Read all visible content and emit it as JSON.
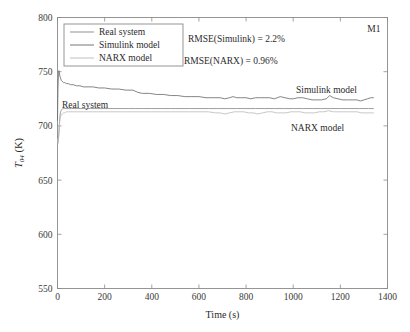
{
  "chart_data": {
    "type": "line",
    "title": "",
    "xlabel": "Time (s)",
    "ylabel": "T",
    "ylabel_sub": "04",
    "ylabel_unit": " (K)",
    "xlim": [
      0,
      1400
    ],
    "ylim": [
      550,
      800
    ],
    "xticks": [
      0,
      200,
      400,
      600,
      800,
      1000,
      1200,
      1400
    ],
    "yticks": [
      550,
      600,
      650,
      700,
      750,
      800
    ],
    "grid": false,
    "legend_position": "top-left",
    "corner_annotation": "M1",
    "annotations": [
      {
        "name": "rmse-simulink",
        "text": "RMSE(Simulink) = 2.2%"
      },
      {
        "name": "rmse-narx",
        "text": "RMSE(NARX) = 0.96%"
      },
      {
        "name": "curve-label-real-system",
        "text": "Real system"
      },
      {
        "name": "curve-label-simulink",
        "text": "Simulink model"
      },
      {
        "name": "curve-label-narx",
        "text": "NARX model"
      }
    ],
    "series": [
      {
        "name": "Real system",
        "color": "#8c8c8c",
        "x": [
          0,
          3,
          6,
          9,
          12,
          15,
          18,
          22,
          26,
          30,
          36,
          42,
          50,
          60,
          72,
          86,
          100,
          120,
          140,
          160,
          185,
          210,
          240,
          270,
          300,
          330,
          360,
          400,
          440,
          480,
          520,
          560,
          600,
          640,
          680,
          720,
          760,
          800,
          840,
          880,
          920,
          960,
          1000,
          1040,
          1080,
          1120,
          1160,
          1200,
          1240,
          1280,
          1320,
          1340
        ],
        "y": [
          690,
          686,
          694,
          706,
          712,
          714,
          715,
          716,
          716,
          716,
          716,
          716,
          716,
          716,
          716,
          716,
          716,
          716,
          716,
          716,
          716,
          716,
          716,
          716,
          716,
          716,
          716,
          716,
          716,
          716,
          716,
          716,
          716,
          716,
          716,
          716,
          716,
          716,
          716,
          716,
          716,
          716,
          716,
          716,
          716,
          716,
          716,
          716,
          716,
          716,
          716,
          716
        ]
      },
      {
        "name": "Simulink model",
        "color": "#6f6f6f",
        "x": [
          0,
          2,
          4,
          6,
          8,
          10,
          13,
          16,
          20,
          25,
          30,
          38,
          46,
          56,
          68,
          80,
          95,
          110,
          130,
          150,
          175,
          200,
          230,
          260,
          290,
          320,
          340,
          360,
          390,
          420,
          450,
          480,
          510,
          540,
          570,
          600,
          630,
          660,
          690,
          710,
          730,
          745,
          760,
          780,
          800,
          820,
          840,
          860,
          880,
          900,
          920,
          945,
          965,
          985,
          1000,
          1020,
          1040,
          1060,
          1080,
          1100,
          1120,
          1140,
          1155,
          1170,
          1190,
          1210,
          1230,
          1250,
          1270,
          1285,
          1300,
          1315,
          1330,
          1340
        ],
        "y": [
          705,
          735,
          748,
          751,
          749,
          746,
          744,
          742,
          741,
          740,
          740,
          739,
          739,
          738,
          738,
          737,
          737,
          736,
          736,
          736,
          735,
          735,
          734,
          734,
          733,
          733,
          731,
          730,
          730,
          729,
          729,
          728,
          728,
          727,
          727,
          727,
          726,
          726,
          726,
          725,
          726,
          727,
          726,
          726,
          726,
          725,
          726,
          726,
          726,
          726,
          725,
          727,
          726,
          725,
          725,
          726,
          726,
          725,
          724,
          724,
          724,
          725,
          728,
          726,
          725,
          724,
          724,
          724,
          724,
          723,
          724,
          725,
          726,
          726
        ]
      },
      {
        "name": "NARX model",
        "color": "#bdbdbd",
        "x": [
          0,
          3,
          6,
          9,
          12,
          16,
          20,
          25,
          30,
          38,
          46,
          56,
          68,
          80,
          95,
          110,
          130,
          150,
          175,
          200,
          240,
          280,
          320,
          360,
          400,
          440,
          480,
          520,
          560,
          600,
          640,
          670,
          690,
          710,
          730,
          750,
          770,
          790,
          810,
          830,
          850,
          870,
          890,
          910,
          930,
          950,
          970,
          990,
          1010,
          1030,
          1050,
          1070,
          1090,
          1110,
          1130,
          1150,
          1170,
          1190,
          1210,
          1230,
          1250,
          1270,
          1290,
          1310,
          1330,
          1340
        ],
        "y": [
          688,
          684,
          693,
          703,
          708,
          710,
          711,
          712,
          712,
          713,
          713,
          713,
          713,
          713,
          713,
          713,
          713,
          713,
          713,
          713,
          713,
          713,
          713,
          713,
          713,
          713,
          713,
          713,
          713,
          713,
          713,
          712,
          712,
          711,
          712,
          713,
          713,
          713,
          712,
          712,
          711,
          712,
          713,
          713,
          712,
          712,
          712,
          713,
          713,
          713,
          712,
          712,
          712,
          713,
          713,
          714,
          713,
          713,
          713,
          713,
          713,
          713,
          712,
          712,
          712,
          712
        ]
      }
    ]
  },
  "legend": {
    "items": [
      {
        "label": "Real system",
        "color": "#8c8c8c"
      },
      {
        "label": "Simulink model",
        "color": "#6f6f6f"
      },
      {
        "label": "NARX model",
        "color": "#bdbdbd"
      }
    ]
  }
}
